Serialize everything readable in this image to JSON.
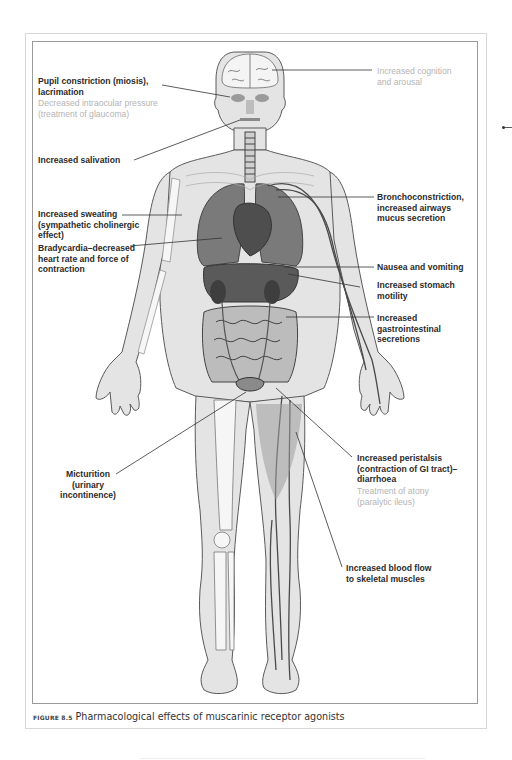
{
  "figure": {
    "label": "FIGURE 8.5",
    "caption": "Pharmacological effects of muscarinic receptor agonists"
  },
  "labels": {
    "cognition": {
      "line1": "Increased cognition",
      "line2": "and arousal"
    },
    "pupil": {
      "line1": "Pupil constriction (miosis),",
      "line2": "lacrimation"
    },
    "intraocular": {
      "line1": "Decreased intraocular pressure",
      "line2": "(treatment of glaucoma)"
    },
    "salivation": {
      "line1": "Increased salivation"
    },
    "sweating": {
      "line1": "Increased sweating",
      "line2": "(sympathetic cholinergic",
      "line3": "effect)"
    },
    "bradycardia": {
      "line1": "Bradycardia–decreased",
      "line2": "heart rate and force of",
      "line3": "contraction"
    },
    "broncho": {
      "line1": "Bronchoconstriction,",
      "line2": "increased airways",
      "line3": "mucus secretion"
    },
    "nausea": {
      "line1": "Nausea and vomiting"
    },
    "stomach": {
      "line1": "Increased stomach",
      "line2": "motility"
    },
    "gi_secretions": {
      "line1": "Increased",
      "line2": "gastrointestinal",
      "line3": "secretions"
    },
    "micturition": {
      "line1": "Micturition",
      "line2": "(urinary",
      "line3": "incontinence)"
    },
    "peristalsis": {
      "line1": "Increased peristalsis",
      "line2": "(contraction of GI tract)–",
      "line3": "diarrhoea"
    },
    "atony": {
      "line1": "Treatment of atony",
      "line2": "(paralytic ileus)"
    },
    "blood_flow": {
      "line1": "Increased blood flow",
      "line2": "to skeletal muscles"
    }
  },
  "colors": {
    "primary_text": "#2b2b2b",
    "secondary_text": "#b4b4b4",
    "body_fill": "#e2e2e2",
    "organ_fill": "#6a6a6a",
    "outline": "#555555"
  }
}
